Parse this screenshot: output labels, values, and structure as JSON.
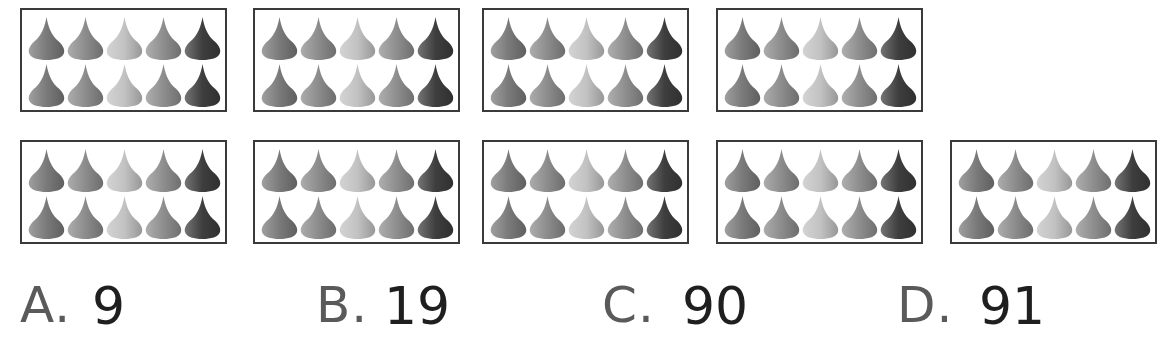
{
  "figure": {
    "box_count": 9,
    "drops_per_box": 10,
    "drop_shades": [
      "#7a7a7a",
      "#8c8c8c",
      "#c2c2c2",
      "#8e8e8e",
      "#3e3e3e"
    ],
    "rows": [
      {
        "boxes": [
          {
            "x": 20,
            "y": 8
          },
          {
            "x": 253,
            "y": 8
          },
          {
            "x": 482,
            "y": 8
          },
          {
            "x": 716,
            "y": 8
          }
        ]
      },
      {
        "boxes": [
          {
            "x": 20,
            "y": 140
          },
          {
            "x": 253,
            "y": 140
          },
          {
            "x": 482,
            "y": 140
          },
          {
            "x": 716,
            "y": 140
          },
          {
            "x": 950,
            "y": 140
          }
        ]
      }
    ]
  },
  "options": [
    {
      "letter": "A.",
      "value": "9"
    },
    {
      "letter": "B.",
      "value": "19"
    },
    {
      "letter": "C.",
      "value": "90"
    },
    {
      "letter": "D.",
      "value": "91"
    }
  ],
  "colors": {
    "border": "#3a3a3a",
    "letter": "#5a5a5a",
    "value": "#1f1f1f"
  }
}
